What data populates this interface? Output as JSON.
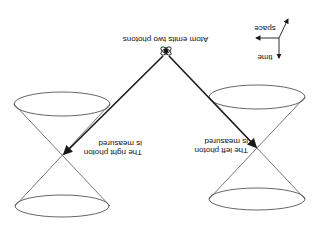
{
  "diagram": {
    "orientation": "rotated-180",
    "colors": {
      "line": "#1a1a1a",
      "cone": "#555555",
      "background": "#ffffff"
    },
    "axes": {
      "space_label": "space",
      "time_label": "time"
    },
    "atom": {
      "label": "Atom emits two photons",
      "icon": "atom-icon"
    },
    "left_event": {
      "label_line1": "The left photon",
      "label_line2": "is measured"
    },
    "right_event": {
      "label_line1": "The right photon",
      "label_line2": "is measured"
    }
  }
}
